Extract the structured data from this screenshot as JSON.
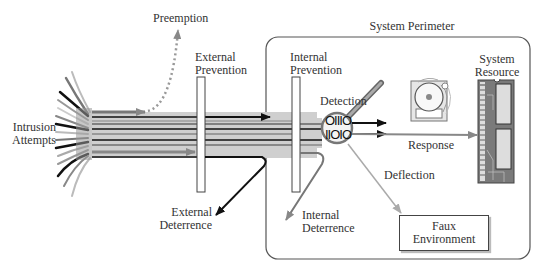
{
  "diagram": {
    "labels": {
      "intrusion_attempts": "Intrusion\nAttempts",
      "preemption": "Preemption",
      "external_prevention": "External\nPrevention",
      "external_deterrence": "External\nDeterrence",
      "system_perimeter": "System Perimeter",
      "internal_prevention": "Internal\nPrevention",
      "internal_deterrence": "Internal\nDeterrence",
      "detection": "Detection",
      "response": "Response",
      "deflection": "Deflection",
      "system_resource": "System\nResource",
      "faux_environment": "Faux\nEnvironment"
    },
    "binary_text": {
      "line1": "OIIIO",
      "line2": "IIOIO"
    },
    "colors": {
      "line_dark": "#111111",
      "line_gray": "#888888",
      "line_light": "#bbbbbb",
      "border": "#444444",
      "text": "#333333"
    }
  }
}
